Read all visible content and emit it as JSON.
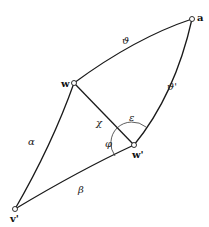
{
  "diagram": {
    "type": "geodesic-quadrilateral",
    "vertices": [
      {
        "id": "a",
        "label": "a",
        "x": 192,
        "y": 19
      },
      {
        "id": "w",
        "label": "w",
        "x": 74,
        "y": 83
      },
      {
        "id": "w_prime",
        "label": "w'",
        "x": 134,
        "y": 145
      },
      {
        "id": "v_prime",
        "label": "v'",
        "x": 15,
        "y": 209
      }
    ],
    "edges": [
      {
        "from": "w",
        "to": "a",
        "label": "ϑ"
      },
      {
        "from": "w_prime",
        "to": "a",
        "label": "ϑ'"
      },
      {
        "from": "w",
        "to": "w_prime",
        "label": "χ"
      },
      {
        "from": "v_prime",
        "to": "w",
        "label": "α"
      },
      {
        "from": "v_prime",
        "to": "w_prime",
        "label": "β"
      }
    ],
    "angles": [
      {
        "at": "w'",
        "label": "ε",
        "between": [
          "χ",
          "ϑ'"
        ]
      },
      {
        "at": "w'",
        "label": "φ",
        "between": [
          "χ",
          "β"
        ]
      }
    ]
  },
  "labels": {
    "a": "a",
    "w": "w",
    "w_prime": "w'",
    "v_prime": "v'",
    "theta": "ϑ",
    "theta_prime": "ϑ'",
    "chi": "χ",
    "epsilon": "ε",
    "phi": "φ",
    "alpha": "α",
    "beta": "β"
  }
}
